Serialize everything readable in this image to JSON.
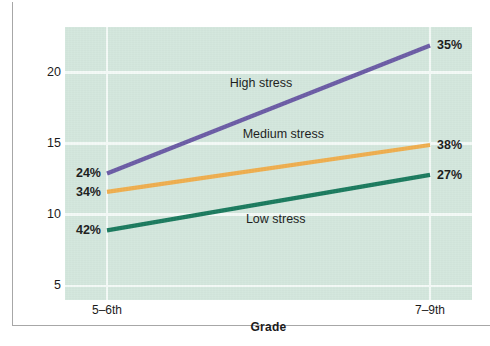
{
  "figure": {
    "panel_color": "#d3e7dd",
    "grid_color": "#f4faf7",
    "frame_color": "#a7a7a7"
  },
  "chart_data": {
    "type": "line",
    "title": "",
    "xlabel": "Grade",
    "ylabel": "Mean level of negative affect",
    "categories": [
      "5–6th",
      "7–9th"
    ],
    "x": [
      0,
      1
    ],
    "xlim": [
      -0.13,
      1.13
    ],
    "ylim": [
      4.0,
      23.2
    ],
    "yticks": [
      5,
      10,
      15,
      20
    ],
    "ytick_labels": [
      "5",
      "10",
      "15",
      "20"
    ],
    "grid": true,
    "legend": "inline-labels",
    "series": [
      {
        "name": "High stress",
        "color": "#6b5ca5",
        "values": [
          12.9,
          21.9
        ],
        "point_labels": [
          "24%",
          "35%"
        ]
      },
      {
        "name": "Medium stress",
        "color": "#efae4e",
        "values": [
          11.6,
          14.9
        ],
        "point_labels": [
          "34%",
          "38%"
        ]
      },
      {
        "name": "Low stress",
        "color": "#1a7a5e",
        "values": [
          8.9,
          12.8
        ],
        "point_labels": [
          "42%",
          "27%"
        ]
      }
    ],
    "annotations": [
      {
        "text": "High stress",
        "x": 0.38,
        "y": 19.2
      },
      {
        "text": "Medium stress",
        "x": 0.42,
        "y": 15.6
      },
      {
        "text": "Low stress",
        "x": 0.43,
        "y": 9.6
      }
    ]
  }
}
